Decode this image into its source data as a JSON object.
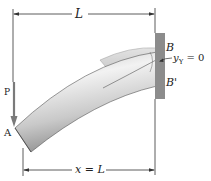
{
  "figure": {
    "top_dimension": {
      "label": "L"
    },
    "bottom_dimension": {
      "label": "x = L"
    },
    "load": {
      "label": "P"
    },
    "points": {
      "free_end": "A",
      "support_top": "B",
      "support_bottom": "B'"
    },
    "annotation": {
      "slope_label": "y",
      "slope_sub": "Y",
      "slope_value": " = 0"
    },
    "colors": {
      "wall": "#8c8c8c",
      "beam_light": "#e8e8e8",
      "beam_dark": "#9a9a9a",
      "line": "#333333",
      "arrow": "#7a7a7a"
    }
  }
}
